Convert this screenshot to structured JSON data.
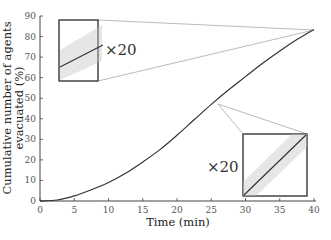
{
  "chart_data": {
    "type": "line",
    "title": "",
    "xlabel": "Time (min)",
    "ylabel_line1": "Cumulative number of agents",
    "ylabel_line2": "evacuated (%)",
    "xlim": [
      0,
      40
    ],
    "ylim": [
      0,
      90
    ],
    "xticks": [
      "0",
      "5",
      "10",
      "15",
      "20",
      "25",
      "30",
      "35",
      "40"
    ],
    "yticks": [
      "0",
      "10",
      "20",
      "30",
      "40",
      "50",
      "60",
      "70",
      "80",
      "90"
    ],
    "grid": false,
    "legend": null,
    "series": [
      {
        "name": "Cumulative evacuated",
        "x": [
          0,
          2.5,
          5,
          7.5,
          10,
          12.5,
          15,
          17.5,
          20,
          22.5,
          25,
          27.5,
          30,
          32.5,
          35,
          37.5,
          40
        ],
        "values": [
          0,
          0.5,
          2.5,
          5.5,
          9,
          13.5,
          19,
          25,
          32,
          39.5,
          47,
          54,
          60.5,
          67,
          73,
          78.5,
          83.5
        ]
      }
    ],
    "annotations": [
      {
        "type": "inset",
        "label": "×20",
        "zoom_point": [
          40,
          83.5
        ],
        "position": "upper-left"
      },
      {
        "type": "inset",
        "label": "×20",
        "zoom_point": [
          25,
          47
        ],
        "position": "lower-right"
      }
    ]
  }
}
